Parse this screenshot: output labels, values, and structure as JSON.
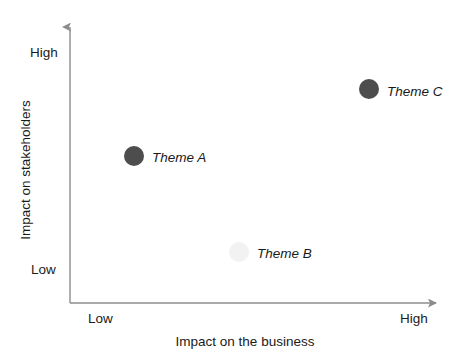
{
  "chart_data": {
    "type": "scatter",
    "title": "",
    "subtitle": "",
    "xlabel": "Impact on the business",
    "ylabel": "Impact on stakeholders",
    "xlim": [
      0,
      100
    ],
    "ylim": [
      0,
      100
    ],
    "grid": false,
    "legend": "none",
    "x_ticks": [
      "Low",
      "High"
    ],
    "y_ticks": [
      "Low",
      "High"
    ],
    "annotations": [
      "Theme A",
      "Theme B",
      "Theme C"
    ],
    "points": [
      {
        "label": "Theme A",
        "x": 17,
        "y": 53,
        "color": "#4d4d4d",
        "radius": 10,
        "px": 134,
        "py": 156,
        "label_px": 152,
        "label_py": 157
      },
      {
        "label": "Theme B",
        "x": 45,
        "y": 19,
        "color": "#f2f2f2",
        "radius": 10,
        "px": 239,
        "py": 252,
        "label_px": 257,
        "label_py": 253
      },
      {
        "label": "Theme C",
        "x": 80,
        "y": 77,
        "color": "#4d4d4d",
        "radius": 10,
        "px": 369,
        "py": 89,
        "label_px": 387,
        "label_py": 91
      }
    ]
  },
  "axes": {
    "y_tick_high": "High",
    "y_tick_low": "Low",
    "x_tick_low": "Low",
    "x_tick_high": "High",
    "y_title": "Impact on stakeholders",
    "x_title": "Impact on the business",
    "axis_color": "#8c8c8c"
  },
  "markers": {
    "theme_a_label": "Theme A",
    "theme_b_label": "Theme B",
    "theme_c_label": "Theme C"
  }
}
